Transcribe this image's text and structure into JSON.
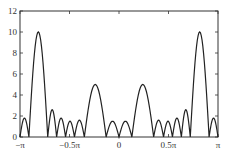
{
  "chart_data": {
    "type": "line",
    "title": "",
    "xlabel": "",
    "ylabel": "",
    "xlim": [
      -1.0,
      1.0
    ],
    "x_units": "pi",
    "ylim": [
      0,
      12
    ],
    "grid": false,
    "legend": null,
    "x_ticks": [
      {
        "value": -1.0,
        "label": "−π"
      },
      {
        "value": -0.5,
        "label": "−0.5π"
      },
      {
        "value": 0.0,
        "label": "0"
      },
      {
        "value": 0.5,
        "label": "0.5π"
      },
      {
        "value": 1.0,
        "label": "π"
      }
    ],
    "y_ticks": [
      {
        "value": 0,
        "label": "0"
      },
      {
        "value": 2,
        "label": "2"
      },
      {
        "value": 4,
        "label": "4"
      },
      {
        "value": 6,
        "label": "6"
      },
      {
        "value": 8,
        "label": "8"
      },
      {
        "value": 10,
        "label": "10"
      },
      {
        "value": 12,
        "label": "12"
      }
    ],
    "series": [
      {
        "name": "magnitude",
        "color": "#222222",
        "lobes": [
          {
            "x0": -1.0,
            "x1": -0.91,
            "peak": 1.8
          },
          {
            "x0": -0.91,
            "x1": -0.72,
            "peak": 10.0
          },
          {
            "x0": -0.72,
            "x1": -0.63,
            "peak": 2.6
          },
          {
            "x0": -0.63,
            "x1": -0.54,
            "peak": 1.8
          },
          {
            "x0": -0.54,
            "x1": -0.45,
            "peak": 1.5
          },
          {
            "x0": -0.45,
            "x1": -0.35,
            "peak": 1.6
          },
          {
            "x0": -0.35,
            "x1": -0.13,
            "peak": 5.0
          },
          {
            "x0": -0.13,
            "x1": 0.0,
            "peak": 1.5
          },
          {
            "x0": 0.0,
            "x1": 0.13,
            "peak": 1.5
          },
          {
            "x0": 0.13,
            "x1": 0.35,
            "peak": 5.0
          },
          {
            "x0": 0.35,
            "x1": 0.45,
            "peak": 1.6
          },
          {
            "x0": 0.45,
            "x1": 0.54,
            "peak": 1.5
          },
          {
            "x0": 0.54,
            "x1": 0.63,
            "peak": 1.8
          },
          {
            "x0": 0.63,
            "x1": 0.72,
            "peak": 2.6
          },
          {
            "x0": 0.72,
            "x1": 0.91,
            "peak": 10.0
          },
          {
            "x0": 0.91,
            "x1": 1.0,
            "peak": 1.8
          }
        ]
      }
    ]
  }
}
